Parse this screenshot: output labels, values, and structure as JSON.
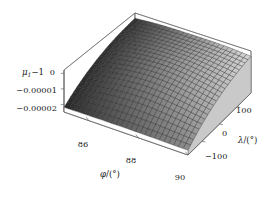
{
  "figure": {
    "kind": "3d-surface-plot",
    "background": "#ffffff",
    "frame_color": "#59595e",
    "mesh_line_color": "#1a1a1a",
    "surface_light": "#d8d8d8",
    "surface_dark": "#1c1c1c"
  },
  "axes": {
    "z": {
      "title_base": "μ",
      "title_sub": "1",
      "title_rest": "−1",
      "ticks": [
        "0",
        "−0.00001",
        "−0.00002"
      ],
      "values": [
        0,
        -1e-05,
        -2e-05
      ],
      "range": [
        -2.5e-05,
        2e-06
      ]
    },
    "x": {
      "title_base": "φ",
      "title_rest": "/(°)",
      "ticks": [
        "86",
        "88",
        "90"
      ],
      "values": [
        86,
        88,
        90
      ],
      "range": [
        85,
        90
      ]
    },
    "y": {
      "title_base": "λ",
      "title_rest": "/(°)",
      "ticks": [
        "100",
        "0",
        "−100"
      ],
      "values": [
        100,
        0,
        -100
      ],
      "range": [
        -180,
        180
      ]
    }
  },
  "chart_data": {
    "type": "surface",
    "title": "",
    "xlabel": "φ/(°)",
    "ylabel": "λ/(°)",
    "zlabel": "μ₁−1",
    "xlim": [
      85,
      90
    ],
    "ylim": [
      -180,
      180
    ],
    "zlim": [
      -2.5e-05,
      2e-06
    ],
    "grid": true,
    "legend": null,
    "x": [
      85,
      85.5,
      86,
      86.5,
      87,
      87.5,
      88,
      88.5,
      89,
      89.5,
      90
    ],
    "y": [
      -180,
      -144,
      -108,
      -72,
      -36,
      0,
      36,
      72,
      108,
      144,
      180
    ],
    "z": [
      [
        -2.2e-05,
        -2.19e-05,
        -2.18e-05,
        -2.17e-05,
        -2.17e-05,
        -2.16e-05,
        -2.17e-05,
        -2.17e-05,
        -2.18e-05,
        -2.19e-05,
        -2.2e-05
      ],
      [
        -1.83e-05,
        -1.78e-05,
        -1.72e-05,
        -1.67e-05,
        -1.64e-05,
        -1.63e-05,
        -1.64e-05,
        -1.67e-05,
        -1.72e-05,
        -1.78e-05,
        -1.83e-05
      ],
      [
        -1.5e-05,
        -1.4e-05,
        -1.3e-05,
        -1.21e-05,
        -1.15e-05,
        -1.13e-05,
        -1.15e-05,
        -1.21e-05,
        -1.3e-05,
        -1.4e-05,
        -1.5e-05
      ],
      [
        -1.21e-05,
        -1.08e-05,
        -9.5e-06,
        -8.4e-06,
        -7.7e-06,
        -7.4e-06,
        -7.7e-06,
        -8.4e-06,
        -9.5e-06,
        -1.08e-05,
        -1.21e-05
      ],
      [
        -9.6e-06,
        -8.1e-06,
        -6.7e-06,
        -5.5e-06,
        -4.7e-06,
        -4.4e-06,
        -4.7e-06,
        -5.5e-06,
        -6.7e-06,
        -8.1e-06,
        -9.6e-06
      ],
      [
        -7.5e-06,
        -5.9e-06,
        -4.5e-06,
        -3.3e-06,
        -2.5e-06,
        -2.2e-06,
        -2.5e-06,
        -3.3e-06,
        -4.5e-06,
        -5.9e-06,
        -7.5e-06
      ],
      [
        -5.7e-06,
        -4.2e-06,
        -2.8e-06,
        -1.7e-06,
        -1e-06,
        -8e-07,
        -1e-06,
        -1.7e-06,
        -2.8e-06,
        -4.2e-06,
        -5.7e-06
      ],
      [
        -4.2e-06,
        -2.9e-06,
        -1.7e-06,
        -8e-07,
        -3e-07,
        -2e-07,
        -3e-07,
        -8e-07,
        -1.7e-06,
        -2.9e-06,
        -4.2e-06
      ],
      [
        -3e-06,
        -1.9e-06,
        -1e-06,
        -4e-07,
        -1e-07,
        0.0,
        -1e-07,
        -4e-07,
        -1e-06,
        -1.9e-06,
        -3e-06
      ],
      [
        -2.1e-06,
        -1.3e-06,
        -6e-07,
        -2e-07,
        0.0,
        0.0,
        0.0,
        -2e-07,
        -6e-07,
        -1.3e-06,
        -2.1e-06
      ],
      [
        -1.4e-06,
        -8e-07,
        -3e-07,
        -1e-07,
        0.0,
        0.0,
        0.0,
        -1e-07,
        -3e-07,
        -8e-07,
        -1.4e-06
      ]
    ],
    "note": "Monotone rise from phi=85 (deepest negative) toward phi=90 (near zero); mild saddle curvature across lambda."
  }
}
